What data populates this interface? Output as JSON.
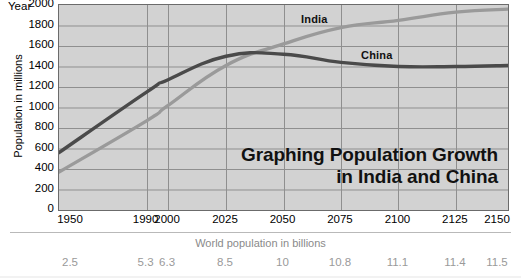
{
  "chart_data": {
    "type": "line",
    "title": "Graphing Population Growth in India and China",
    "title_line1": "Graphing Population Growth",
    "title_line2": "in India and China",
    "xlabel": "Year",
    "ylabel": "Population in millions",
    "secondary_xlabel": "World population in billions",
    "ylim": [
      0,
      2000
    ],
    "yticks": [
      2000,
      1800,
      1600,
      1400,
      1200,
      1000,
      800,
      600,
      400,
      200,
      0
    ],
    "grid": true,
    "legend_position": "inline-labels",
    "categories": [
      "1950",
      "1990",
      "2000",
      "2025",
      "2050",
      "2075",
      "2100",
      "2125",
      "2150"
    ],
    "world_population_billions": [
      "2.5",
      "5.3",
      "6.3",
      "8.5",
      "10",
      "10.8",
      "11.1",
      "11.4",
      "11.5"
    ],
    "series": [
      {
        "name": "India",
        "color": "#9a9a9a",
        "values": [
          370,
          870,
          1020,
          1410,
          1620,
          1780,
          1850,
          1930,
          1960
        ]
      },
      {
        "name": "China",
        "color": "#4a4a4a",
        "values": [
          560,
          1150,
          1270,
          1500,
          1520,
          1440,
          1400,
          1400,
          1410
        ]
      }
    ]
  },
  "axis": {
    "year_word": "Year",
    "ylabel": "Population in millions",
    "secondary_caption": "World population in billions"
  },
  "colors": {
    "plot_background": "#d2d2d2",
    "plot_border": "#6b6b6b",
    "gridline": "#8f8f8f",
    "india": "#9a9a9a",
    "china": "#4a4a4a",
    "caption_gray": "#8a8a8a"
  }
}
